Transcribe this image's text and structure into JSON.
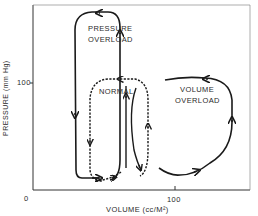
{
  "diagram": {
    "type": "pressure-volume loops",
    "axes": {
      "x_label": "VOLUME (cc/M²)",
      "y_label": "PRESSURE (mm Hg)",
      "x_ticks": [
        "0",
        "100"
      ],
      "y_ticks": [
        "100"
      ]
    },
    "loops": [
      {
        "name": "pressure-overload",
        "label_line1": "PRESSURE",
        "label_line2": "OVERLOAD",
        "style": "solid"
      },
      {
        "name": "normal",
        "label": "NORMAL",
        "style": "dashed"
      },
      {
        "name": "volume-overload",
        "label_line1": "VOLUME",
        "label_line2": "OVERLOAD",
        "style": "solid"
      }
    ],
    "colors": {
      "line": "#1a1a1a",
      "background": "#ffffff"
    }
  }
}
